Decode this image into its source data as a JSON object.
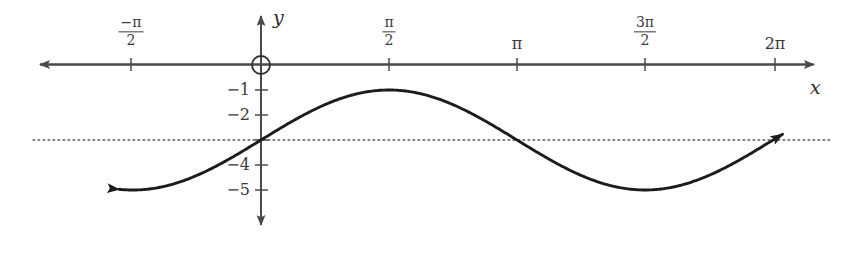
{
  "figure": {
    "width": 850,
    "height": 260,
    "background": "#ffffff",
    "curve_color": "#1c1c1c",
    "axis_color": "#4a4a4a",
    "label_color": "#3a3a3a",
    "asymptote_color": "#5a5a5a"
  },
  "axes": {
    "x_axis_label": "x",
    "y_axis_label": "y",
    "origin_marker": "open-circle",
    "x_ticks": [
      {
        "label_parts": {
          "numerator": "−π",
          "denominator": "2"
        },
        "value": -1.5707963,
        "px": 131
      },
      {
        "label_parts": {
          "numerator": "π",
          "denominator": "2"
        },
        "value": 1.5707963,
        "px": 389
      },
      {
        "label": "π",
        "value": 3.1415927,
        "px": 517
      },
      {
        "label_parts": {
          "numerator": "3π",
          "denominator": "2"
        },
        "value": 4.712389,
        "px": 645
      },
      {
        "label": "2π",
        "value": 6.2831853,
        "px": 775
      }
    ],
    "y_ticks": [
      {
        "label": "−1",
        "value": -1,
        "px": 90
      },
      {
        "label": "−2",
        "value": -2,
        "px": 115
      },
      {
        "label": "−4",
        "value": -4,
        "px": 165
      },
      {
        "label": "−5",
        "value": -5,
        "px": 190
      }
    ]
  },
  "chart_data": {
    "type": "line",
    "title": "",
    "xlabel": "x",
    "ylabel": "y",
    "xlim": [
      -2.0,
      6.6
    ],
    "ylim": [
      -5.9,
      0.45
    ],
    "grid": false,
    "legend": null,
    "series": [
      {
        "name": "y = -3 + 2 sin(x)",
        "equation": "y = -3 + 2*sin(x)",
        "midline": -3,
        "amplitude": 2,
        "period": 6.2831853,
        "phase": 0,
        "color": "#1c1c1c",
        "style": "solid",
        "arrow_start": true,
        "arrow_end": true,
        "x": [
          -1.74,
          -1.5708,
          -1.2,
          -0.9,
          -0.6,
          -0.3,
          0,
          0.3,
          0.6,
          0.9,
          1.2,
          1.5708,
          1.9,
          2.2,
          2.5,
          2.8,
          3.1416,
          3.5,
          3.8,
          4.1,
          4.4,
          4.712389,
          5.0,
          5.3,
          5.6,
          5.9,
          6.2,
          6.4
        ],
        "y": [
          -4.96,
          -5.0,
          -4.86,
          -4.57,
          -4.13,
          -3.59,
          -3.0,
          -2.41,
          -1.87,
          -1.43,
          -1.14,
          -1.0,
          -1.11,
          -1.38,
          -1.8,
          -2.33,
          -3.0,
          -3.7,
          -4.25,
          -4.64,
          -4.92,
          -5.0,
          -4.92,
          -4.67,
          -4.26,
          -3.75,
          -3.13,
          -2.71
        ],
        "key_points": [
          {
            "label": "y-intercept",
            "x": 0,
            "y": -3
          },
          {
            "label": "maximum",
            "x": 1.5707963,
            "y": -1
          },
          {
            "label": "minimum",
            "x": 4.712389,
            "y": -5
          }
        ]
      }
    ],
    "reference_lines": [
      {
        "name": "midline",
        "orientation": "horizontal",
        "value": -3,
        "style": "dotted",
        "color": "#5a5a5a"
      }
    ]
  }
}
